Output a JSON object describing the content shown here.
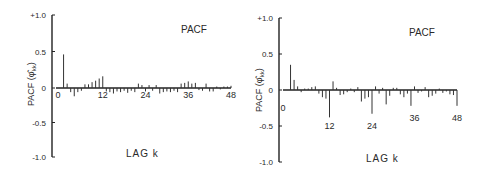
{
  "chart_data": [
    {
      "type": "bar",
      "title": "PACF",
      "xlabel": "LAG k",
      "ylabel": "PACF (φ̂kk)",
      "ylim": [
        -1.0,
        1.0
      ],
      "yticks": [
        "+1.0",
        "0.5",
        "0",
        "-0.5",
        "-1.0"
      ],
      "ytick_values": [
        1.0,
        0.5,
        0,
        -0.5,
        -1.0
      ],
      "xticks": [
        "0",
        "12",
        "24",
        "36",
        "48"
      ],
      "xtick_values": [
        0,
        12,
        24,
        36,
        48
      ],
      "xlim": [
        0,
        48
      ],
      "grid": false,
      "legend": false,
      "lags": [
        1,
        2,
        3,
        4,
        5,
        6,
        7,
        8,
        9,
        10,
        11,
        12,
        13,
        14,
        15,
        16,
        17,
        18,
        19,
        20,
        21,
        22,
        23,
        24,
        25,
        26,
        27,
        28,
        29,
        30,
        31,
        32,
        33,
        34,
        35,
        36,
        37,
        38,
        39,
        40,
        41,
        42,
        43,
        44,
        45,
        46,
        47,
        48
      ],
      "values": [
        0.46,
        0.06,
        -0.06,
        -0.12,
        -0.06,
        -0.04,
        0.05,
        0.05,
        0.08,
        0.1,
        0.13,
        0.16,
        -0.05,
        -0.06,
        -0.08,
        -0.05,
        -0.06,
        -0.04,
        -0.07,
        -0.04,
        -0.06,
        0.06,
        0.04,
        -0.05,
        0.04,
        -0.04,
        0.04,
        -0.08,
        -0.06,
        -0.05,
        -0.06,
        -0.04,
        -0.06,
        0.06,
        0.07,
        0.09,
        0.06,
        0.07,
        -0.03,
        -0.04,
        0.06,
        -0.05,
        -0.05,
        0.02,
        -0.02,
        0.02,
        0.02,
        0.03
      ]
    },
    {
      "type": "bar",
      "title": "PACF",
      "xlabel": "LAG k",
      "ylabel": "PACF (φ̂kk)",
      "ylim": [
        -1.0,
        1.0
      ],
      "yticks": [
        "+1.0",
        "0.5",
        "0",
        "-0.5",
        "-1.0"
      ],
      "ytick_values": [
        1.0,
        0.5,
        0,
        -0.5,
        -1.0
      ],
      "xticks": [
        "0",
        "12",
        "24",
        "36",
        "48"
      ],
      "xtick_values": [
        0,
        12,
        24,
        36,
        48
      ],
      "xlim": [
        0,
        48
      ],
      "grid": false,
      "legend": false,
      "lags": [
        1,
        2,
        3,
        4,
        5,
        6,
        7,
        8,
        9,
        10,
        11,
        12,
        13,
        14,
        15,
        16,
        17,
        18,
        19,
        20,
        21,
        22,
        23,
        24,
        25,
        26,
        27,
        28,
        29,
        30,
        31,
        32,
        33,
        34,
        35,
        36,
        37,
        38,
        39,
        40,
        41,
        42,
        43,
        44,
        45,
        46,
        47,
        48
      ],
      "values": [
        0.35,
        0.14,
        0.05,
        -0.03,
        0.02,
        0.02,
        0.04,
        0.05,
        -0.05,
        -0.1,
        -0.12,
        -0.38,
        0.12,
        0.03,
        -0.07,
        -0.06,
        -0.03,
        0.02,
        -0.03,
        0.04,
        -0.16,
        -0.12,
        -0.1,
        -0.33,
        0.05,
        -0.05,
        0.03,
        -0.2,
        -0.08,
        0.03,
        0.03,
        -0.06,
        -0.1,
        -0.05,
        -0.22,
        0.05,
        -0.04,
        -0.02,
        0.04,
        -0.1,
        -0.08,
        -0.05,
        0.02,
        -0.04,
        -0.02,
        -0.06,
        -0.07,
        -0.22
      ]
    }
  ],
  "charts": [
    {
      "title": "PACF",
      "xlabel": "LAG k",
      "ylabel_main": "PACF (",
      "ylabel_sym": "φ̂",
      "ylabel_sub": "kk",
      "ylabel_close": ")"
    },
    {
      "title": "PACF",
      "xlabel": "LAG k",
      "ylabel_main": "PACF (",
      "ylabel_sym": "φ̂",
      "ylabel_sub": "kk",
      "ylabel_close": ")"
    }
  ]
}
